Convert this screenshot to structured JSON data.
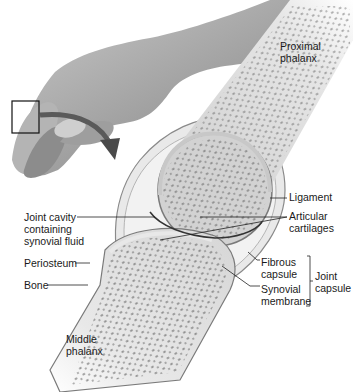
{
  "figure": {
    "labels": {
      "proximal_phalanx": "Proximal\nphalanx",
      "ligament": "Ligament",
      "articular_cartilages": "Articular\ncartilages",
      "joint_cavity": "Joint cavity\ncontaining\nsynovial fluid",
      "periosteum": "Periosteum",
      "bone": "Bone",
      "fibrous_capsule": "Fibrous\ncapsule",
      "synovial_membrane": "Synovial\nmembrane",
      "joint_capsule": "Joint\ncapsule",
      "middle_phalanx": "Middle\nphalanx"
    },
    "colors": {
      "background": "#ffffff",
      "bone_fill": "#d4d4d4",
      "cartilage": "#e2e2e2",
      "spongy_spots": "#555555",
      "skin": "#a8a8a8",
      "leader_line": "#222222",
      "text": "#1a1a1a"
    }
  }
}
